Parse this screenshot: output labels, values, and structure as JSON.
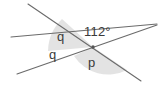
{
  "diagram": {
    "kind": "intersecting-lines-angle-diagram",
    "background_color": "#ffffff",
    "line_color": "#6b6b6b",
    "shade_color": "#d9d9d9",
    "text_color": "#3a3a3a",
    "vertex": {
      "x": 93,
      "y": 47
    },
    "labels": {
      "angle_measure": "112°",
      "q_upper": "q",
      "q_lower": "q",
      "p": "p"
    },
    "lines": [
      {
        "name": "line-steep-descending",
        "x1": 28,
        "y1": 4,
        "x2": 141,
        "y2": 81
      },
      {
        "name": "line-shallow-ascending-right",
        "x1": 11,
        "y1": 37,
        "x2": 157,
        "y2": 24
      },
      {
        "name": "line-from-lower-left",
        "x1": 17,
        "y1": 74,
        "x2": 157,
        "y2": 25
      }
    ],
    "wedges": [
      {
        "name": "wedge-angle-112",
        "path": "M 93 47 L 48 51 A 46 46 0 0 1 62 19 Z"
      },
      {
        "name": "wedge-angle-p",
        "path": "M 93 47 L 127 70 A 41 41 0 0 1 74 56 Z"
      }
    ]
  }
}
